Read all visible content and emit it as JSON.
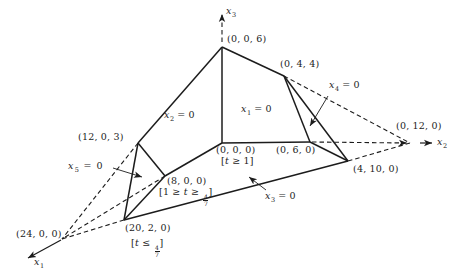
{
  "figure": {
    "background": "#ffffff",
    "ink": "#1c1c1c"
  },
  "axis_labels": {
    "x1": {
      "var": "x",
      "sub": "1"
    },
    "x2": {
      "var": "x",
      "sub": "2"
    },
    "x3": {
      "var": "x",
      "sub": "3"
    }
  },
  "face_labels": {
    "x1_eq_0": {
      "var": "x",
      "sub": "1",
      "rest": " = 0"
    },
    "x2_eq_0": {
      "var": "x",
      "sub": "2",
      "rest": " = 0"
    },
    "x3_eq_0": {
      "var": "x",
      "sub": "3",
      "rest": " = 0"
    },
    "x4_eq_0": {
      "var": "x",
      "sub": "4",
      "rest": " = 0"
    },
    "x5_eq_0": {
      "var": "x",
      "sub": "5",
      "rest": " = 0"
    }
  },
  "vertex_labels": {
    "v006": "(0, 0, 6)",
    "v044": "(0, 4, 4)",
    "v0120": "(0, 12, 0)",
    "v1203": "(12, 0, 3)",
    "v000": "(0, 0, 0)",
    "v060": "(0, 6, 0)",
    "v4100": "(4, 10, 0)",
    "v800": "(8, 0, 0)",
    "v2020": "(20, 2, 0)",
    "v2400": "(24, 0, 0)"
  },
  "constraint_labels": {
    "at_v000": {
      "open": "[",
      "var": "t",
      "rest": " ≥ 1]"
    },
    "at_v800": {
      "open": "[1 ≥ ",
      "var": "t",
      "mid": " ≥ ",
      "num": "4",
      "den": "7",
      "close": "]"
    },
    "at_v2020": {
      "open": "[",
      "var": "t",
      "mid": " ≤ ",
      "num": "4",
      "den": "7",
      "close": "]"
    }
  }
}
